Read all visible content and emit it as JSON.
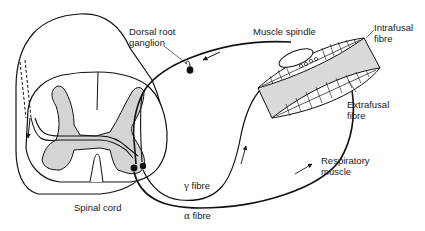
{
  "diagram": {
    "labels": {
      "dorsal_root_ganglion": [
        "Dorsal root",
        "ganglion"
      ],
      "muscle_spindle": "Muscle spindle",
      "intrafusal_fibre": [
        "Intrafusal",
        "fibre"
      ],
      "extrafusal_fibre": [
        "Extrafusal",
        "fibre"
      ],
      "respiratory_muscle": [
        "Respiratory",
        "muscle"
      ],
      "gamma_fibre": {
        "symbol": "γ",
        "text": "fibre"
      },
      "alpha_fibre": {
        "symbol": "α",
        "text": "fibre"
      },
      "spinal_cord": "Spinal cord"
    },
    "colors": {
      "line": "#111111",
      "grey_matter": "#d4d4d4",
      "muscle_fill": "#d9d9d9",
      "background": "#ffffff"
    }
  }
}
